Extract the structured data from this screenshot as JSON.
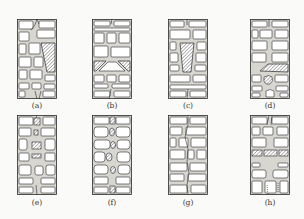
{
  "figure": {
    "panels": [
      {
        "id": "a",
        "label": "(a)",
        "x": 17,
        "y": 19,
        "feature": "trapezoidal hatched block, right side, with mortar cracks"
      },
      {
        "id": "b",
        "label": "(b)",
        "x": 92,
        "y": 19,
        "feature": "two hatched wedge blocks forming a triangular void"
      },
      {
        "id": "c",
        "label": "(c)",
        "x": 168,
        "y": 19,
        "feature": "tapered hatched block in center"
      },
      {
        "id": "d",
        "label": "(d)",
        "x": 250,
        "y": 19,
        "feature": "slanted hatched block with rubble below"
      },
      {
        "id": "e",
        "label": "(e)",
        "x": 17,
        "y": 115,
        "feature": "vertical column of small hatched blocks in mortar"
      },
      {
        "id": "f",
        "label": "(f)",
        "x": 92,
        "y": 115,
        "feature": "staggered oval hatched stones along central joint"
      },
      {
        "id": "g",
        "label": "(g)",
        "x": 168,
        "y": 115,
        "feature": "plain brick wall with vertical mortar crack"
      },
      {
        "id": "h",
        "label": "(h)",
        "x": 250,
        "y": 115,
        "feature": "horizontal hatched course across the wall"
      }
    ],
    "colors": {
      "line": "#2a2a2a",
      "mortar": "#d8d6d0",
      "brick": "#ffffff",
      "hatch": "#444444"
    }
  }
}
